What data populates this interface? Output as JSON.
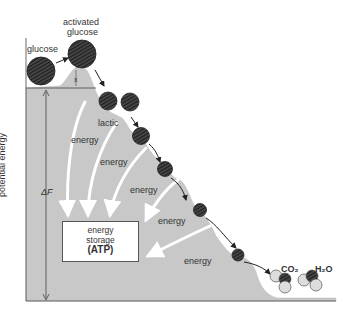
{
  "labels": {
    "activated_glucose_1": "activated",
    "activated_glucose_2": "glucose",
    "glucose": "glucose",
    "x": "x",
    "lactic": "lactic",
    "energy": [
      "energy",
      "energy",
      "energy",
      "energy",
      "energy"
    ],
    "y_axis": "potential energy",
    "delta_f": "ΔF",
    "co2": "CO₂",
    "h2o": "H₂O"
  },
  "storage_box": {
    "line1": "energy",
    "line2": "storage",
    "line3": "(ATP)"
  },
  "colors": {
    "hill": "#c8c8c8",
    "molecule": "#3a3a3a",
    "arrow_white": "#ffffff",
    "arrow_dark": "#222222"
  }
}
